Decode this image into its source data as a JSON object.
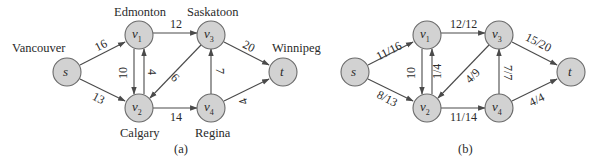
{
  "diagrams": [
    {
      "caption": "(a)",
      "nodes": {
        "s": {
          "label": "s",
          "sub": "",
          "city": "Vancouver"
        },
        "v1": {
          "label": "v",
          "sub": "1",
          "city": "Edmonton"
        },
        "v2": {
          "label": "v",
          "sub": "2",
          "city": "Calgary"
        },
        "v3": {
          "label": "v",
          "sub": "3",
          "city": "Saskatoon"
        },
        "v4": {
          "label": "v",
          "sub": "4",
          "city": "Regina"
        },
        "t": {
          "label": "t",
          "sub": "",
          "city": "Winnipeg"
        }
      },
      "edges": {
        "s_v1": "16",
        "s_v2": "13",
        "v1_v2": "10",
        "v2_v1": "4",
        "v1_v3": "12",
        "v3_v2": "9",
        "v2_v4": "14",
        "v4_v3": "7",
        "v3_t": "20",
        "v4_t": "4"
      }
    },
    {
      "caption": "(b)",
      "nodes": {
        "s": {
          "label": "s",
          "sub": ""
        },
        "v1": {
          "label": "v",
          "sub": "1"
        },
        "v2": {
          "label": "v",
          "sub": "2"
        },
        "v3": {
          "label": "v",
          "sub": "3"
        },
        "v4": {
          "label": "v",
          "sub": "4"
        },
        "t": {
          "label": "t",
          "sub": ""
        }
      },
      "edges": {
        "s_v1": "11/16",
        "s_v2": "8/13",
        "v1_v2": "10",
        "v2_v1": "1/4",
        "v1_v3": "12/12",
        "v3_v2": "4/9",
        "v2_v4": "11/14",
        "v4_v3": "7/7",
        "v3_t": "15/20",
        "v4_t": "4/4"
      }
    }
  ],
  "colors": {
    "node_fill": "#d2d2d2",
    "node_stroke": "#6a6a6a",
    "edge": "#4a4a4a",
    "text": "#2a2a2a"
  }
}
